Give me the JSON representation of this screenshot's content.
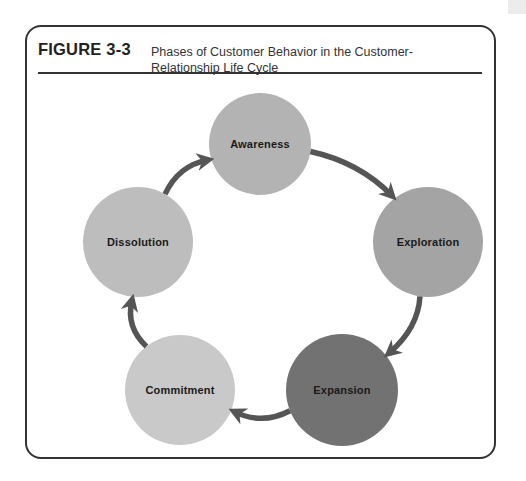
{
  "figure": {
    "label": "FIGURE 3-3",
    "caption": "Phases of Customer Behavior in the Customer-Relationship Life Cycle"
  },
  "colors": {
    "frame": "#333333",
    "arrow": "#555555",
    "text": "#1a1a1a"
  },
  "cycle": {
    "nodes": [
      {
        "id": "awareness",
        "label": "Awareness",
        "cx": 260,
        "cy": 144,
        "r": 51,
        "fill": "#b3b3b3"
      },
      {
        "id": "exploration",
        "label": "Exploration",
        "cx": 428,
        "cy": 242,
        "r": 55,
        "fill": "#a4a4a4"
      },
      {
        "id": "expansion",
        "label": "Expansion",
        "cx": 342,
        "cy": 390,
        "r": 56,
        "fill": "#727272"
      },
      {
        "id": "commitment",
        "label": "Commitment",
        "cx": 180,
        "cy": 390,
        "r": 55,
        "fill": "#c9c9c9"
      },
      {
        "id": "dissolution",
        "label": "Dissolution",
        "cx": 138,
        "cy": 242,
        "r": 55,
        "fill": "#bdbdbd"
      }
    ],
    "arrows": [
      {
        "from": "awareness",
        "to": "exploration"
      },
      {
        "from": "exploration",
        "to": "expansion"
      },
      {
        "from": "expansion",
        "to": "commitment"
      },
      {
        "from": "commitment",
        "to": "dissolution"
      },
      {
        "from": "dissolution",
        "to": "awareness"
      }
    ]
  }
}
